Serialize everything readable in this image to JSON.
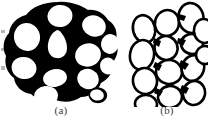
{
  "figure": {
    "panels": [
      {
        "id": "a",
        "caption": "(a)",
        "icon": "cellular-microstructure-thick-wall",
        "description": "Cellular microstructure with thick dark cell walls and white closed cells",
        "wall_color": "#000000",
        "cell_color": "#ffffff",
        "wall_style": "filled-matrix",
        "cell_count": 12
      },
      {
        "id": "b",
        "caption": "(b)",
        "icon": "cellular-microstructure-thin-wall",
        "description": "Cellular microstructure with thin dark cell wall outlines and white cells",
        "wall_color": "#000000",
        "cell_color": "#ffffff",
        "wall_style": "outline",
        "cell_count": 14
      }
    ],
    "background_color": "#ffffff",
    "caption_color": "#3a3a3a"
  }
}
